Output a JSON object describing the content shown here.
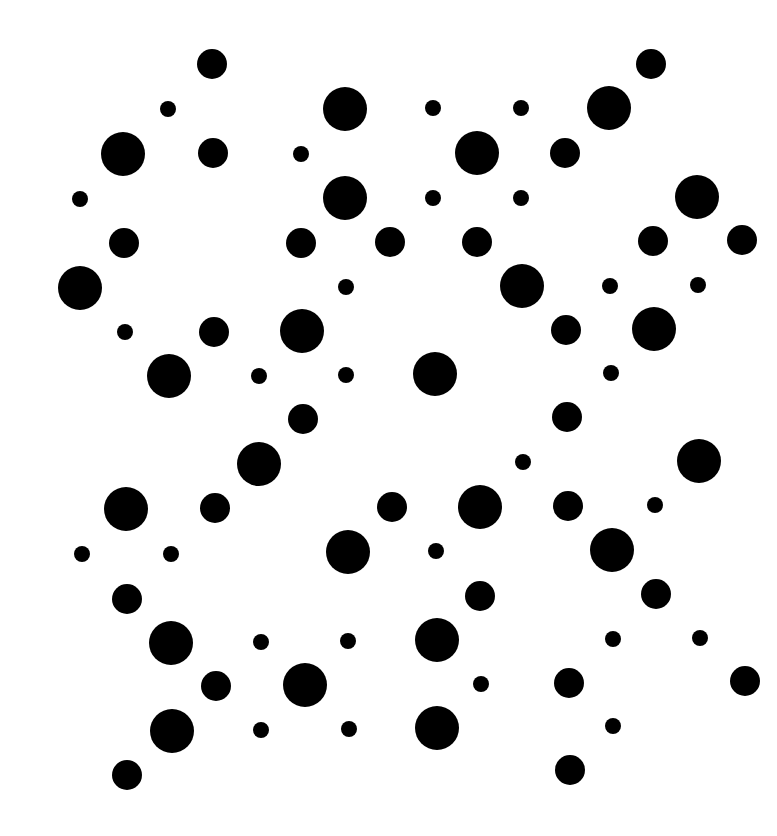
{
  "image": {
    "width": 777,
    "height": 836,
    "background": "#ffffff",
    "dot_color": "#000000",
    "sizes": {
      "small": 8,
      "medium": 15,
      "large": 22
    }
  },
  "dots": [
    {
      "x": 212,
      "y": 64,
      "s": "medium"
    },
    {
      "x": 651,
      "y": 64,
      "s": "medium"
    },
    {
      "x": 168,
      "y": 109,
      "s": "small"
    },
    {
      "x": 345,
      "y": 109,
      "s": "large"
    },
    {
      "x": 433,
      "y": 108,
      "s": "small"
    },
    {
      "x": 521,
      "y": 108,
      "s": "small"
    },
    {
      "x": 609,
      "y": 108,
      "s": "large"
    },
    {
      "x": 123,
      "y": 154,
      "s": "large"
    },
    {
      "x": 213,
      "y": 153,
      "s": "medium"
    },
    {
      "x": 301,
      "y": 154,
      "s": "small"
    },
    {
      "x": 477,
      "y": 153,
      "s": "large"
    },
    {
      "x": 565,
      "y": 153,
      "s": "medium"
    },
    {
      "x": 80,
      "y": 199,
      "s": "small"
    },
    {
      "x": 345,
      "y": 198,
      "s": "large"
    },
    {
      "x": 433,
      "y": 198,
      "s": "small"
    },
    {
      "x": 521,
      "y": 198,
      "s": "small"
    },
    {
      "x": 697,
      "y": 197,
      "s": "large"
    },
    {
      "x": 124,
      "y": 243,
      "s": "medium"
    },
    {
      "x": 301,
      "y": 243,
      "s": "medium"
    },
    {
      "x": 390,
      "y": 242,
      "s": "medium"
    },
    {
      "x": 477,
      "y": 242,
      "s": "medium"
    },
    {
      "x": 653,
      "y": 241,
      "s": "medium"
    },
    {
      "x": 742,
      "y": 240,
      "s": "medium"
    },
    {
      "x": 80,
      "y": 288,
      "s": "large"
    },
    {
      "x": 346,
      "y": 287,
      "s": "small"
    },
    {
      "x": 522,
      "y": 286,
      "s": "large"
    },
    {
      "x": 610,
      "y": 286,
      "s": "small"
    },
    {
      "x": 698,
      "y": 285,
      "s": "small"
    },
    {
      "x": 125,
      "y": 332,
      "s": "small"
    },
    {
      "x": 214,
      "y": 332,
      "s": "medium"
    },
    {
      "x": 302,
      "y": 331,
      "s": "large"
    },
    {
      "x": 566,
      "y": 330,
      "s": "medium"
    },
    {
      "x": 654,
      "y": 329,
      "s": "large"
    },
    {
      "x": 169,
      "y": 376,
      "s": "large"
    },
    {
      "x": 259,
      "y": 376,
      "s": "small"
    },
    {
      "x": 346,
      "y": 375,
      "s": "small"
    },
    {
      "x": 435,
      "y": 374,
      "s": "large"
    },
    {
      "x": 611,
      "y": 373,
      "s": "small"
    },
    {
      "x": 303,
      "y": 419,
      "s": "medium"
    },
    {
      "x": 567,
      "y": 417,
      "s": "medium"
    },
    {
      "x": 259,
      "y": 464,
      "s": "large"
    },
    {
      "x": 523,
      "y": 462,
      "s": "small"
    },
    {
      "x": 699,
      "y": 461,
      "s": "large"
    },
    {
      "x": 126,
      "y": 509,
      "s": "large"
    },
    {
      "x": 215,
      "y": 508,
      "s": "medium"
    },
    {
      "x": 392,
      "y": 507,
      "s": "medium"
    },
    {
      "x": 480,
      "y": 507,
      "s": "large"
    },
    {
      "x": 568,
      "y": 506,
      "s": "medium"
    },
    {
      "x": 655,
      "y": 505,
      "s": "small"
    },
    {
      "x": 82,
      "y": 554,
      "s": "small"
    },
    {
      "x": 171,
      "y": 554,
      "s": "small"
    },
    {
      "x": 348,
      "y": 552,
      "s": "large"
    },
    {
      "x": 436,
      "y": 551,
      "s": "small"
    },
    {
      "x": 612,
      "y": 550,
      "s": "large"
    },
    {
      "x": 127,
      "y": 599,
      "s": "medium"
    },
    {
      "x": 480,
      "y": 596,
      "s": "medium"
    },
    {
      "x": 656,
      "y": 594,
      "s": "medium"
    },
    {
      "x": 171,
      "y": 643,
      "s": "large"
    },
    {
      "x": 261,
      "y": 642,
      "s": "small"
    },
    {
      "x": 348,
      "y": 641,
      "s": "small"
    },
    {
      "x": 437,
      "y": 640,
      "s": "large"
    },
    {
      "x": 613,
      "y": 639,
      "s": "small"
    },
    {
      "x": 700,
      "y": 638,
      "s": "small"
    },
    {
      "x": 216,
      "y": 686,
      "s": "medium"
    },
    {
      "x": 305,
      "y": 685,
      "s": "large"
    },
    {
      "x": 481,
      "y": 684,
      "s": "small"
    },
    {
      "x": 569,
      "y": 683,
      "s": "medium"
    },
    {
      "x": 745,
      "y": 681,
      "s": "medium"
    },
    {
      "x": 172,
      "y": 731,
      "s": "large"
    },
    {
      "x": 261,
      "y": 730,
      "s": "small"
    },
    {
      "x": 349,
      "y": 729,
      "s": "small"
    },
    {
      "x": 437,
      "y": 728,
      "s": "large"
    },
    {
      "x": 613,
      "y": 726,
      "s": "small"
    },
    {
      "x": 127,
      "y": 775,
      "s": "medium"
    },
    {
      "x": 570,
      "y": 770,
      "s": "medium"
    }
  ]
}
